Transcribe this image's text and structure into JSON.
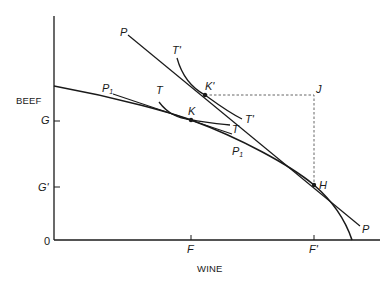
{
  "diagram": {
    "type": "production-possibility-trade-diagram",
    "axes": {
      "y_label": "BEEF",
      "x_label": "WINE",
      "origin_label": "0",
      "y_ticks": [
        "G",
        "G'"
      ],
      "x_ticks": [
        "F",
        "F'"
      ]
    },
    "curves": {
      "ppf_label": "P",
      "ppf_label_sub": "1",
      "ppf_label_lower": "P",
      "ppf_label_lower_sub": "1",
      "price_line_label_top": "P",
      "price_line_label_bottom": "P",
      "indifference_low_label_top": "T",
      "indifference_low_label_end": "T",
      "indifference_high_label_top": "T'",
      "indifference_high_label_end": "T'"
    },
    "points": {
      "k": "K",
      "k_prime": "K'",
      "h": "H",
      "j": "J"
    },
    "colors": {
      "line": "#1a1a1a",
      "dashed": "#555555"
    }
  }
}
